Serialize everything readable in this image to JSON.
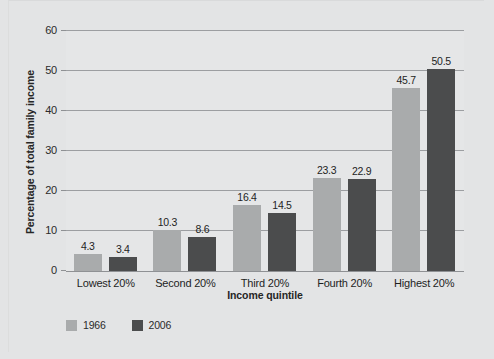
{
  "chart_data": {
    "type": "bar",
    "title": "",
    "subtitle": "",
    "xlabel": "Income quintile",
    "ylabel": "Percentage of total family income",
    "categories": [
      "Lowest 20%",
      "Second 20%",
      "Third 20%",
      "Fourth 20%",
      "Highest 20%"
    ],
    "series": [
      {
        "name": "1966",
        "color": "#a9abac",
        "values": [
          4.3,
          10.3,
          16.4,
          23.3,
          45.7
        ]
      },
      {
        "name": "2006",
        "color": "#4b4c4d",
        "values": [
          3.4,
          8.6,
          14.5,
          22.9,
          50.5
        ]
      }
    ],
    "value_labels": [
      [
        "4.3",
        "10.3",
        "16.4",
        "23.3",
        "45.7"
      ],
      [
        "3.4",
        "8.6",
        "14.5",
        "22.9",
        "50.5"
      ]
    ],
    "ylim": [
      0,
      60
    ],
    "ytick_values": [
      0,
      10,
      20,
      30,
      40,
      50,
      60
    ],
    "ytick_labels": [
      "0",
      "10",
      "20",
      "30",
      "40",
      "50",
      "60"
    ],
    "grid": "horizontal",
    "legend_position": "bottom-left",
    "plot_background": "#e5e6e7",
    "figure_background": "#e3e4e5",
    "gridline_color": "#9c9ea1",
    "axis_color": "#8f9194"
  }
}
